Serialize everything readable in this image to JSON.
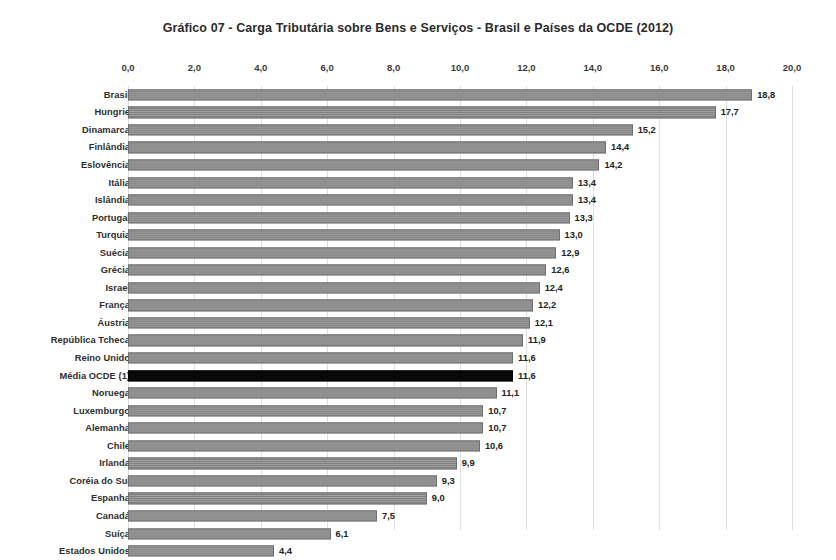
{
  "chart_data": {
    "type": "bar",
    "orientation": "horizontal",
    "title": "Gráfico 07 - Carga Tributária sobre Bens e Serviços - Brasil e Países da OCDE (2012)",
    "xlabel": "",
    "ylabel": "",
    "xlim": [
      0.0,
      20.0
    ],
    "xtick_step": 2.0,
    "xticks": [
      "0,0",
      "2,0",
      "4,0",
      "6,0",
      "8,0",
      "10,0",
      "12,0",
      "14,0",
      "16,0",
      "18,0",
      "20,0"
    ],
    "xtick_values": [
      0,
      2,
      4,
      6,
      8,
      10,
      12,
      14,
      16,
      18,
      20
    ],
    "grid": true,
    "legend": null,
    "decimal_separator": ",",
    "bar_color": "#8e8e8e",
    "highlight_color": "#080808",
    "highlight_category": "Média OCDE (1)",
    "categories": [
      "Brasil",
      "Hungrie",
      "Dinamarca",
      "Finlândia",
      "Eslovência",
      "Itália",
      "Islândia",
      "Portugal",
      "Turquia",
      "Suécia",
      "Grécia",
      "Israel",
      "França",
      "Áustria",
      "República Tcheca",
      "Reino Unido",
      "Média OCDE (1)",
      "Noruega",
      "Luxemburgo",
      "Alemanha",
      "Chile",
      "Irlanda",
      "Coréia do Sul",
      "Espanha",
      "Canadá",
      "Suíça",
      "Estados Unidos"
    ],
    "values": [
      18.8,
      17.7,
      15.2,
      14.4,
      14.2,
      13.4,
      13.4,
      13.3,
      13.0,
      12.9,
      12.6,
      12.4,
      12.2,
      12.1,
      11.9,
      11.6,
      11.6,
      11.1,
      10.7,
      10.7,
      10.6,
      9.9,
      9.3,
      9.0,
      7.5,
      6.1,
      4.4
    ],
    "value_labels": [
      "18,8",
      "17,7",
      "15,2",
      "14,4",
      "14,2",
      "13,4",
      "13,4",
      "13,3",
      "13,0",
      "12,9",
      "12,6",
      "12,4",
      "12,2",
      "12,1",
      "11,9",
      "11,6",
      "11,6",
      "11,1",
      "10,7",
      "10,7",
      "10,6",
      "9,9",
      "9,3",
      "9,0",
      "7,5",
      "6,1",
      "4,4"
    ]
  }
}
